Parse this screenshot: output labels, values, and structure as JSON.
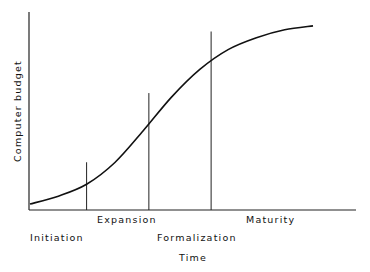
{
  "diagram": {
    "title": "",
    "y_axis_label": "Computer budget",
    "x_axis_label": "Time",
    "curve": "S-shaped growth curve of computer budget over time",
    "stages": [
      {
        "name": "Initiation"
      },
      {
        "name": "Expansion"
      },
      {
        "name": "Formalization"
      },
      {
        "name": "Maturity"
      }
    ]
  },
  "chart_data": {
    "type": "line",
    "title": "",
    "xlabel": "Time",
    "ylabel": "Computer budget",
    "xlim": [
      0,
      1
    ],
    "ylim": [
      0,
      1
    ],
    "grid": false,
    "legend": "none",
    "series": [
      {
        "name": "Computer budget",
        "x": [
          0.0,
          0.1,
          0.2,
          0.3,
          0.4,
          0.5,
          0.6,
          0.7,
          0.8,
          0.9,
          1.0
        ],
        "y": [
          0.03,
          0.07,
          0.13,
          0.24,
          0.4,
          0.57,
          0.71,
          0.81,
          0.87,
          0.91,
          0.93
        ]
      }
    ],
    "stage_boundaries_x": [
      0.2,
      0.42,
      0.64
    ],
    "stage_boundary_labels": [
      "Expansion",
      "Formalization",
      "Maturity"
    ],
    "stage_labels": [
      "Initiation",
      "Expansion",
      "Formalization",
      "Maturity"
    ]
  }
}
